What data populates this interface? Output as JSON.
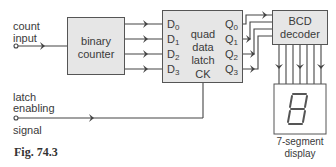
{
  "figure": {
    "caption": "Fig. 74.3"
  },
  "inputs": {
    "count_input": {
      "line1": "count",
      "line2": "input"
    },
    "latch_enable": {
      "line1": "latch",
      "line2": "enabling",
      "line3": "signal"
    }
  },
  "blocks": {
    "counter": {
      "line1": "binary",
      "line2": "counter"
    },
    "latch": {
      "line1": "quad",
      "line2": "data",
      "line3": "latch",
      "inputs": [
        {
          "base": "D",
          "sub": "0"
        },
        {
          "base": "D",
          "sub": "1"
        },
        {
          "base": "D",
          "sub": "2"
        },
        {
          "base": "D",
          "sub": "3"
        }
      ],
      "outputs": [
        {
          "base": "Q",
          "sub": "0"
        },
        {
          "base": "Q",
          "sub": "1"
        },
        {
          "base": "Q",
          "sub": "2"
        },
        {
          "base": "Q",
          "sub": "3"
        }
      ],
      "clock": "CK"
    },
    "decoder": {
      "line1": "BCD",
      "line2": "decoder"
    },
    "display": {
      "line1": "7-segment",
      "line2": "display",
      "digit": "8"
    }
  },
  "colors": {
    "line": "#444444",
    "box_fill": "#e6e6e6"
  }
}
